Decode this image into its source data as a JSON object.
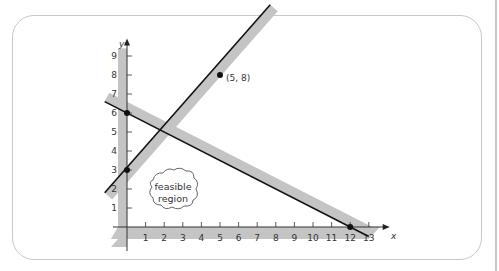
{
  "chart_data": {
    "type": "line",
    "title": "",
    "xlabel": "x",
    "ylabel": "y",
    "xlim": [
      0,
      13
    ],
    "ylim": [
      0,
      9
    ],
    "x_ticks": [
      "1",
      "2",
      "3",
      "4",
      "5",
      "6",
      "7",
      "8",
      "9",
      "10",
      "11",
      "12",
      "13"
    ],
    "y_ticks": [
      "1",
      "2",
      "3",
      "4",
      "5",
      "6",
      "7",
      "8",
      "9"
    ],
    "series": [
      {
        "name": "line1",
        "equation": "y = x + 3",
        "points": [
          [
            -1.2,
            1.8
          ],
          [
            7.7,
            11.7
          ]
        ],
        "shaded_side": "below-right"
      },
      {
        "name": "line2",
        "equation": "y = -0.5x + 6",
        "points": [
          [
            -1.2,
            6.6
          ],
          [
            13,
            -0.5
          ]
        ],
        "shaded_side": "above"
      }
    ],
    "marked_points": [
      {
        "x": 0,
        "y": 3
      },
      {
        "x": 0,
        "y": 6
      },
      {
        "x": 5,
        "y": 8,
        "label": "(5, 8)"
      },
      {
        "x": 12,
        "y": 0
      }
    ],
    "annotation": "feasible region",
    "grid": false
  },
  "labels": {
    "point_label": "(5, 8)",
    "x_axis": "x",
    "y_axis": "y",
    "cloud_line1": "feasible",
    "cloud_line2": "region"
  }
}
